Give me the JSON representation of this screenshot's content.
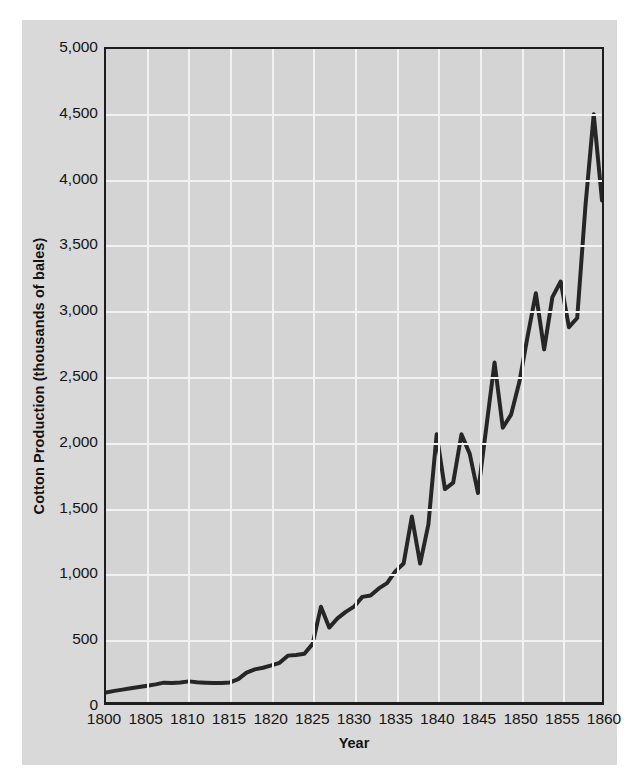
{
  "chart_data": {
    "type": "line",
    "title": "",
    "xlabel": "Year",
    "ylabel": "Cotton Production (thousands of bales)",
    "xlim": [
      1800,
      1860
    ],
    "ylim": [
      0,
      5000
    ],
    "xticks": [
      1800,
      1805,
      1810,
      1815,
      1820,
      1825,
      1830,
      1835,
      1840,
      1845,
      1850,
      1855,
      1860
    ],
    "xtick_labels": [
      "1800",
      "1805",
      "1810",
      "1815",
      "1820",
      "1825",
      "1830",
      "1835",
      "1840",
      "1845",
      "1850",
      "1855",
      "1860"
    ],
    "yticks": [
      0,
      500,
      1000,
      1500,
      2000,
      2500,
      3000,
      3500,
      4000,
      4500,
      5000
    ],
    "ytick_labels": [
      "0",
      "500",
      "1,000",
      "1,500",
      "2,000",
      "2,500",
      "3,000",
      "3,500",
      "4,000",
      "4,500",
      "5,000"
    ],
    "grid": true,
    "legend": "none",
    "series": [
      {
        "name": "Cotton Production",
        "color": "#262626",
        "line_width": 4,
        "x": [
          1800,
          1801,
          1802,
          1803,
          1804,
          1805,
          1806,
          1807,
          1808,
          1809,
          1810,
          1811,
          1812,
          1813,
          1814,
          1815,
          1816,
          1817,
          1818,
          1819,
          1820,
          1821,
          1822,
          1823,
          1824,
          1825,
          1826,
          1827,
          1828,
          1829,
          1830,
          1831,
          1832,
          1833,
          1834,
          1835,
          1836,
          1837,
          1838,
          1839,
          1840,
          1841,
          1842,
          1843,
          1844,
          1845,
          1846,
          1847,
          1848,
          1849,
          1850,
          1851,
          1852,
          1853,
          1854,
          1855,
          1856,
          1857,
          1858,
          1859,
          1860
        ],
        "y": [
          73,
          85,
          95,
          105,
          115,
          125,
          135,
          148,
          145,
          150,
          158,
          152,
          148,
          145,
          146,
          150,
          175,
          225,
          250,
          262,
          280,
          300,
          355,
          360,
          370,
          445,
          730,
          570,
          640,
          690,
          730,
          805,
          815,
          870,
          910,
          1000,
          1060,
          1420,
          1060,
          1360,
          2050,
          1630,
          1680,
          2050,
          1900,
          1600,
          2100,
          2600,
          2100,
          2200,
          2450,
          2800,
          3130,
          2700,
          3100,
          3220,
          2870,
          2940,
          3800,
          4500,
          3840
        ],
        "annotations": []
      }
    ]
  },
  "axes": {
    "y_axis_label": "Cotton Production (thousands of bales)",
    "x_axis_label": "Year"
  },
  "colors": {
    "figure_background": "#d9d9d9",
    "plot_background": "#d4d4d4",
    "gridline": "#f2f2f2",
    "axis_line": "#1d1d1d",
    "line": "#262626",
    "text": "#151515"
  }
}
